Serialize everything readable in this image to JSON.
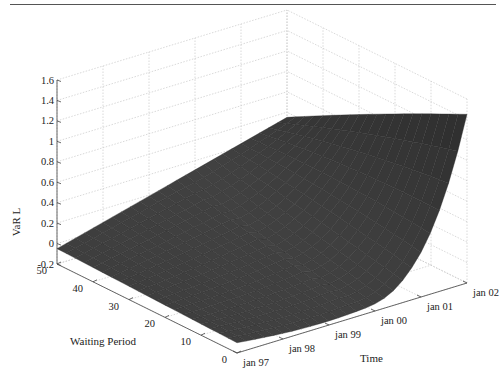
{
  "chart_data": {
    "type": "surface3d",
    "title": "",
    "xlabel": "Time",
    "ylabel": "Waiting Period",
    "zlabel": "VaR L",
    "x_ticks": [
      "jan 97",
      "jan 98",
      "jan 99",
      "jan 00",
      "jan 01",
      "jan 02"
    ],
    "y_ticks": [
      "0",
      "10",
      "20",
      "30",
      "40",
      "50"
    ],
    "z_ticks": [
      "-0.2",
      "0",
      "0.2",
      "0.4",
      "0.6",
      "0.8",
      "1",
      "1.2",
      "1.4",
      "1.6"
    ],
    "xlim": [
      "jan 97",
      "jan 02"
    ],
    "ylim": [
      0,
      50
    ],
    "zlim": [
      -0.2,
      1.6
    ],
    "grid": true,
    "colormap": "dark gray",
    "surface_samples": {
      "description": "Approximate VaR L read along edges of the surface",
      "waiting_period_50": {
        "x": [
          "jan 97",
          "jan 98",
          "jan 99",
          "jan 00",
          "jan 01",
          "jan 02"
        ],
        "z": [
          -0.05,
          0.05,
          0.15,
          0.3,
          0.45,
          0.55
        ]
      },
      "waiting_period_0": {
        "x": [
          "jan 97",
          "jan 98",
          "jan 99",
          "jan 00",
          "jan 01",
          "jan 02"
        ],
        "z": [
          -0.1,
          -0.15,
          -0.15,
          -0.12,
          0.2,
          1.45
        ]
      },
      "time_jan97": {
        "y": [
          50,
          40,
          30,
          20,
          10,
          0
        ],
        "z": [
          -0.05,
          -0.1,
          -0.14,
          -0.15,
          -0.13,
          -0.1
        ]
      },
      "time_jan02": {
        "y": [
          50,
          40,
          30,
          20,
          10,
          0
        ],
        "z": [
          0.55,
          0.65,
          0.8,
          1.0,
          1.2,
          1.45
        ]
      }
    }
  },
  "labels": {
    "zlabel": "VaR L",
    "ylabel": "Waiting Period",
    "xlabel": "Time"
  }
}
